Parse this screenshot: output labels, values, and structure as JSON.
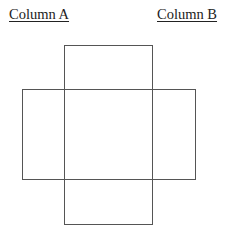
{
  "headings": {
    "column_a": "Column A",
    "column_b": "Column B"
  },
  "diagram": {
    "stroke_color": "#555555",
    "stroke_width": 1,
    "shapes": [
      {
        "name": "vertical-rectangle",
        "x": 64,
        "y": 45,
        "width": 88,
        "height": 179
      },
      {
        "name": "horizontal-rectangle",
        "x": 22,
        "y": 89,
        "width": 173,
        "height": 90
      }
    ]
  }
}
